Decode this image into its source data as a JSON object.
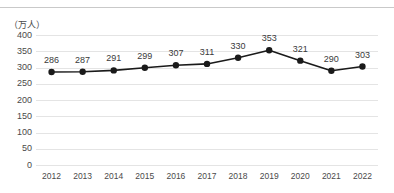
{
  "header": {
    "clipped_caption": "",
    "has_top_rule": true
  },
  "chart_data": {
    "type": "line",
    "title": "",
    "subtitle": "",
    "xlabel": "",
    "ylabel": "",
    "unit_label": "（万人）",
    "categories": [
      "2012",
      "2013",
      "2014",
      "2015",
      "2016",
      "2017",
      "2018",
      "2019",
      "2020",
      "2021",
      "2022"
    ],
    "values": [
      286,
      287,
      291,
      299,
      307,
      311,
      330,
      353,
      321,
      290,
      303
    ],
    "data_labels": [
      "286",
      "287",
      "291",
      "299",
      "307",
      "311",
      "330",
      "353",
      "321",
      "290",
      "303"
    ],
    "ylim": [
      0,
      400
    ],
    "yticks": [
      400,
      350,
      300,
      250,
      200,
      150,
      100,
      50,
      0
    ],
    "ytick_labels": [
      "400",
      "350",
      "300",
      "250",
      "200",
      "150",
      "100",
      "50",
      "0"
    ],
    "grid": {
      "horizontal": true,
      "vertical": false,
      "color": "#e4e4e4"
    },
    "legend": {
      "visible": false,
      "position": "none"
    },
    "series_style": {
      "line_color": "#1a1a1a",
      "line_width": 1.6,
      "marker": "circle",
      "marker_color": "#1a1a1a",
      "marker_radius": 3.2
    },
    "axis_text_color": "#4a4a4a",
    "background": "#ffffff"
  }
}
